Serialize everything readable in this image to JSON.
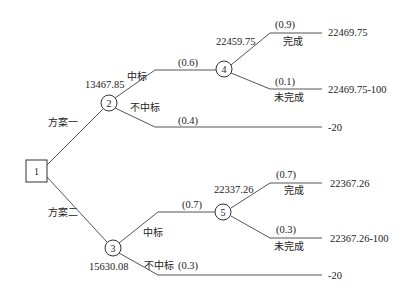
{
  "diagram": {
    "type": "decision-tree",
    "decision_node": {
      "id": "1",
      "label": "1"
    },
    "branches": [
      {
        "label": "方案一",
        "chance_node": {
          "id": "2",
          "label": "2",
          "expected_value": "13467.85"
        },
        "outcomes": [
          {
            "label": "中标",
            "probability": "(0.6)",
            "chance_node": {
              "id": "4",
              "label": "4",
              "expected_value": "22459.75"
            },
            "outcomes": [
              {
                "label": "完成",
                "probability": "(0.9)",
                "payoff": "22469.75"
              },
              {
                "label": "未完成",
                "probability": "(0.1)",
                "payoff": "22469.75-100"
              }
            ]
          },
          {
            "label": "不中标",
            "probability": "(0.4)",
            "payoff": "-20"
          }
        ]
      },
      {
        "label": "方案二",
        "chance_node": {
          "id": "3",
          "label": "3",
          "expected_value": "15630.08"
        },
        "outcomes": [
          {
            "label": "中标",
            "probability": "(0.7)",
            "chance_node": {
              "id": "5",
              "label": "5",
              "expected_value": "22337.26"
            },
            "outcomes": [
              {
                "label": "完成",
                "probability": "(0.7)",
                "payoff": "22367.26"
              },
              {
                "label": "未完成",
                "probability": "(0.3)",
                "payoff": "22367.26-100"
              }
            ]
          },
          {
            "label": "不中标",
            "probability": "(0.3)",
            "payoff": "-20"
          }
        ]
      }
    ]
  }
}
